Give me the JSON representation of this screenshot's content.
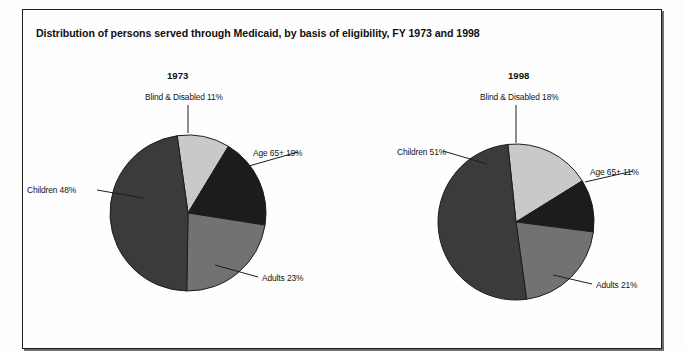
{
  "top_cut_text": "",
  "figure": {
    "title": "Distribution of persons served through Medicaid, by basis of eligibility, FY 1973 and 1998"
  },
  "colors": {
    "blind_disabled": "#c9c9c9",
    "age65": "#1c1c1c",
    "adults": "#727272",
    "children": "#3b3b3b",
    "outline": "#1d1d1d",
    "frame": "#1d1d1d",
    "text": "#131313"
  },
  "chart_data": [
    {
      "type": "pie",
      "title": "1973",
      "categories": [
        "Blind & Disabled",
        "Age 65+",
        "Adults",
        "Children"
      ],
      "values": [
        11,
        19,
        23,
        48
      ],
      "unit": "%",
      "start_angle_deg": -8,
      "labels": [
        {
          "text": "Blind & Disabled 11%"
        },
        {
          "text": "Age 65+ 19%"
        },
        {
          "text": "Adults 23%"
        },
        {
          "text": "Children 48%"
        }
      ],
      "legend": "none",
      "grid": false
    },
    {
      "type": "pie",
      "title": "1998",
      "categories": [
        "Blind & Disabled",
        "Age 65+",
        "Adults",
        "Children"
      ],
      "values": [
        18,
        11,
        21,
        51
      ],
      "unit": "%",
      "start_angle_deg": -6,
      "labels": [
        {
          "text": "Blind & Disabled 18%"
        },
        {
          "text": "Age 65+ 11%"
        },
        {
          "text": "Adults 21%"
        },
        {
          "text": "Children 51%"
        }
      ],
      "legend": "none",
      "grid": false
    }
  ]
}
